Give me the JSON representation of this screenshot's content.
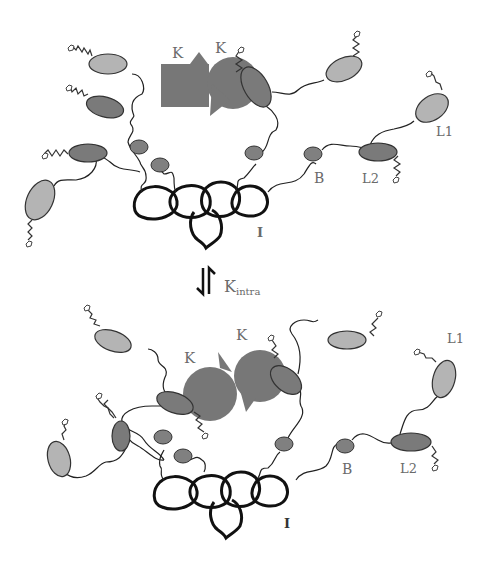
{
  "figure": {
    "top_panel": {
      "kinase_labels": [
        "K",
        "K"
      ],
      "labels": {
        "B": "B",
        "L2": "L2",
        "L1": "L1",
        "I": "I"
      }
    },
    "equilibrium": {
      "symbol": "⇅",
      "constant": "K",
      "subscript": "intra"
    },
    "bottom_panel": {
      "kinase_labels": [
        "K",
        "K"
      ],
      "labels": {
        "B": "B",
        "L2": "L2",
        "L1": "L1",
        "I": "I"
      }
    },
    "colors": {
      "kinase": "#777777",
      "light_ellipse": "#b4b4b4",
      "dark_ellipse": "#7a7a7a",
      "small_bead": "#808080",
      "scaffold": "#111111",
      "label": "#6a6a6a"
    }
  }
}
